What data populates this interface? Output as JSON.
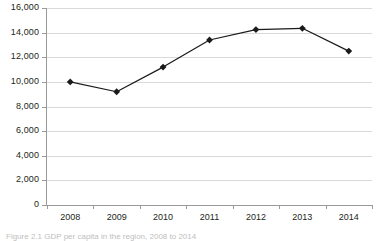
{
  "figure": {
    "caption": "Figure 2.1  GDP per capita in the region, 2008 to 2014",
    "background_color": "#ffffff",
    "line_color": "#1a1a1a",
    "gridline_color": "#d9d9d9",
    "axis_color": "#9a9a9a",
    "text_color": "#231f20"
  },
  "chart_data": {
    "type": "line",
    "title": "",
    "xlabel": "",
    "ylabel": "",
    "categories": [
      "2008",
      "2009",
      "2010",
      "2011",
      "2012",
      "2013",
      "2014"
    ],
    "values": [
      10000,
      9200,
      11200,
      13400,
      14250,
      14350,
      12500
    ],
    "series": [
      {
        "name": "",
        "values": [
          10000,
          9200,
          11200,
          13400,
          14250,
          14350,
          12500
        ]
      }
    ],
    "ylim": [
      0,
      16000
    ],
    "ytick_values": [
      0,
      2000,
      4000,
      6000,
      8000,
      10000,
      12000,
      14000,
      16000
    ],
    "ytick_labels": [
      "0",
      "2,000",
      "4,000",
      "6,000",
      "8,000",
      "10,000",
      "12,000",
      "14,000",
      "16,000"
    ],
    "grid": true,
    "grid_axis": "y",
    "legend": false,
    "legend_position": "none",
    "marker": "diamond",
    "marker_color": "#1a1a1a",
    "line_width": 1.2
  }
}
